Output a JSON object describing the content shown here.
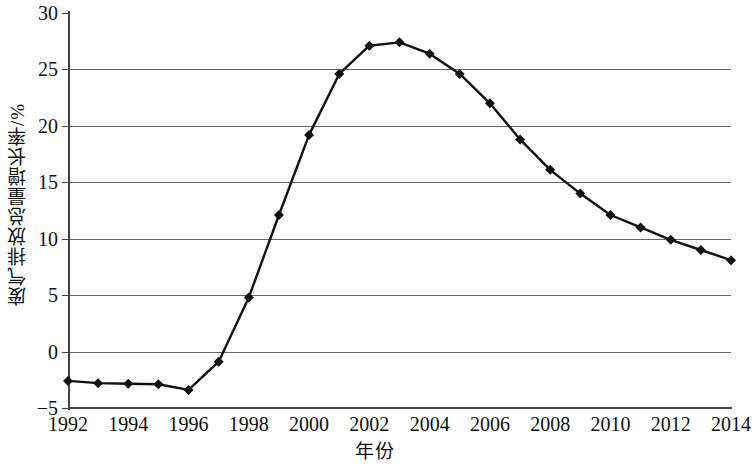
{
  "chart_data": {
    "type": "line",
    "title": "",
    "xlabel": "年份",
    "ylabel": "废气排放总量增长率/%",
    "xlim": [
      1992,
      2014
    ],
    "ylim": [
      -5,
      30
    ],
    "grid": true,
    "legend": "none",
    "marker": "diamond",
    "line_color": "#111111",
    "marker_color": "#111111",
    "grid_color": "#666666",
    "x": [
      1992,
      1993,
      1994,
      1995,
      1996,
      1997,
      1998,
      1999,
      2000,
      2001,
      2002,
      2003,
      2004,
      2005,
      2006,
      2007,
      2008,
      2009,
      2010,
      2011,
      2012,
      2013,
      2014
    ],
    "values": [
      -2.6,
      -2.8,
      -2.85,
      -2.9,
      -3.4,
      -0.9,
      4.8,
      12.1,
      19.2,
      24.6,
      27.1,
      27.4,
      26.4,
      24.6,
      22.0,
      18.8,
      16.1,
      14.0,
      12.1,
      11.0,
      9.9,
      9.0,
      8.1
    ],
    "xticks": [
      1992,
      1994,
      1996,
      1998,
      2000,
      2002,
      2004,
      2006,
      2008,
      2010,
      2012,
      2014
    ],
    "xtick_labels": [
      "1992",
      "1994",
      "1996",
      "1998",
      "2000",
      "2002",
      "2004",
      "2006",
      "2008",
      "2010",
      "2012",
      "2014"
    ],
    "yticks": [
      -5,
      0,
      5,
      10,
      15,
      20,
      25,
      30
    ],
    "ytick_labels": [
      "−5",
      "0",
      "5",
      "10",
      "15",
      "20",
      "25",
      "30"
    ]
  }
}
